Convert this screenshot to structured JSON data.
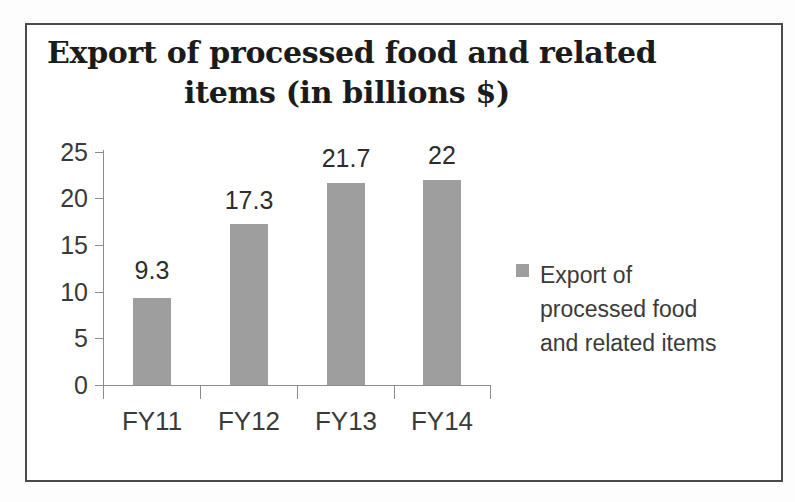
{
  "chart_data": {
    "type": "bar",
    "title": "Export of processed food and related items (in billions $)",
    "title_lines": [
      "Export of processed food and related",
      "items (in billions $)"
    ],
    "categories": [
      "FY11",
      "FY12",
      "FY13",
      "FY14"
    ],
    "values": [
      9.3,
      17.3,
      21.7,
      22
    ],
    "value_labels": [
      "9.3",
      "17.3",
      "21.7",
      "22"
    ],
    "series": [
      {
        "name": "Export of processed food and related items",
        "values": [
          9.3,
          17.3,
          21.7,
          22
        ],
        "color": "#9e9e9e"
      }
    ],
    "xlabel": "",
    "ylabel": "",
    "ylim": [
      0,
      25
    ],
    "y_ticks": [
      0,
      5,
      10,
      15,
      20,
      25
    ],
    "y_tick_labels": [
      "0",
      "5",
      "10",
      "15",
      "20",
      "25"
    ],
    "grid": false,
    "legend_position": "right",
    "legend_entries": [
      {
        "label": "Export of processed food and related items",
        "label_lines": [
          "Export of",
          "processed food",
          "and related items"
        ],
        "color": "#9e9e9e"
      }
    ],
    "colors": {
      "bar": "#9e9e9e",
      "axis": "#8c8c8c",
      "text": "#3a3a3a",
      "title": "#1b1b1b",
      "frame": "#4a4a4a",
      "background": "#ffffff"
    }
  }
}
